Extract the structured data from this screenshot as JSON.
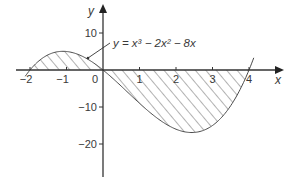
{
  "chart_data": {
    "type": "line",
    "title": "",
    "function": "y = x^3 - 2x^2 - 8x",
    "annotation": "y = x³ − 2x² − 8x",
    "xlabel": "x",
    "ylabel": "y",
    "xlim": [
      -2.2,
      4.7
    ],
    "ylim": [
      -28,
      18
    ],
    "x_ticks": [
      -2,
      -1,
      0,
      1,
      2,
      3,
      4
    ],
    "x_tick_labels": [
      "−2",
      "−1",
      "0",
      "1",
      "2",
      "3",
      "4"
    ],
    "y_ticks": [
      10,
      -10,
      -20
    ],
    "y_tick_labels": [
      "10",
      "−10",
      "−20"
    ],
    "grid": false,
    "shaded_regions": [
      {
        "from": -2,
        "to": 0,
        "side": "above x-axis"
      },
      {
        "from": 0,
        "to": 4,
        "side": "below x-axis"
      }
    ],
    "roots": [
      -2,
      0,
      4
    ],
    "series": [
      {
        "name": "y = x³ − 2x² − 8x",
        "x": [
          -2,
          -1.5,
          -1,
          -0.5,
          0,
          0.5,
          1,
          1.5,
          2,
          2.5,
          3,
          3.5,
          4
        ],
        "values": [
          0,
          3.375,
          5,
          3.375,
          0,
          -4.375,
          -9,
          -12.375,
          -16,
          -13.125,
          -15,
          -10.125,
          0
        ]
      }
    ],
    "colors": {
      "line": "#4a4a4a",
      "hatch": "#555555",
      "text": "#3a3a3a"
    }
  }
}
